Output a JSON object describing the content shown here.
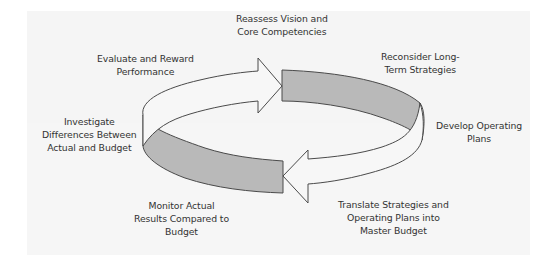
{
  "diagram": {
    "type": "cycle",
    "colors": {
      "background": "#f5f5f5",
      "band_fill": "#b9b9b9",
      "arrow_fill": "#f7f7f7",
      "outline": "#4a4a4a",
      "text": "#333333"
    },
    "steps": [
      {
        "id": "reassess",
        "lines": [
          "Reassess Vision and",
          "Core Competencies"
        ]
      },
      {
        "id": "reconsider",
        "lines": [
          "Reconsider Long-",
          "Term Strategies"
        ]
      },
      {
        "id": "develop",
        "lines": [
          "Develop Operating",
          "Plans"
        ]
      },
      {
        "id": "translate",
        "lines": [
          "Translate Strategies and",
          "Operating Plans into",
          "Master Budget"
        ]
      },
      {
        "id": "monitor",
        "lines": [
          "Monitor Actual",
          "Results Compared to",
          "Budget"
        ]
      },
      {
        "id": "investigate",
        "lines": [
          "Investigate",
          "Differences Between",
          "Actual and Budget"
        ]
      },
      {
        "id": "evaluate",
        "lines": [
          "Evaluate and Reward",
          "Performance"
        ]
      }
    ]
  }
}
